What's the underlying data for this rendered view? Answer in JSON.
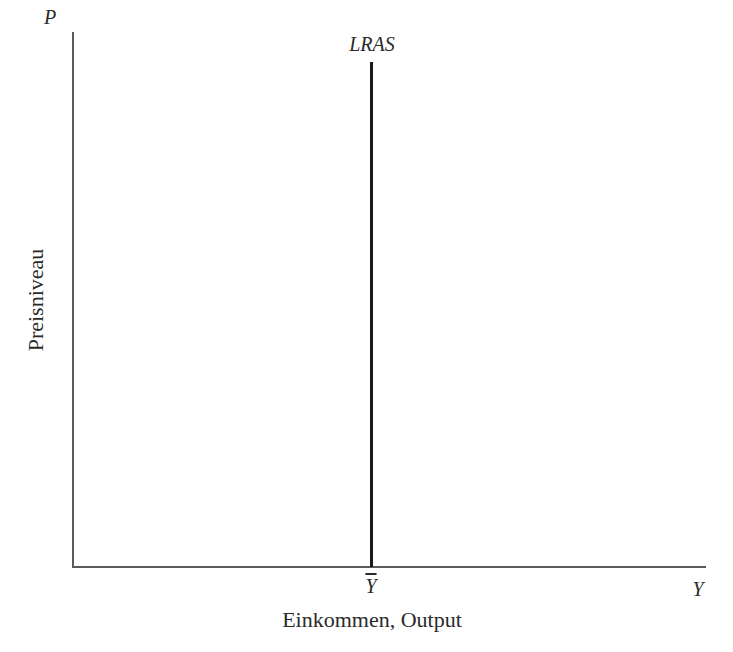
{
  "chart_data": {
    "type": "line",
    "title": "",
    "xlabel": "Einkommen, Output",
    "ylabel": "Preisniveau",
    "x_axis_symbol": "Y",
    "y_axis_symbol": "P",
    "x_ticks": [
      {
        "label": "Ȳ",
        "position": "potential output (natural level)"
      }
    ],
    "series": [
      {
        "name": "LRAS",
        "kind": "vertical_line",
        "x": "Ȳ",
        "description": "Long-run aggregate supply curve, vertical at potential output"
      }
    ],
    "grid": false,
    "legend": "none (curve labeled directly)",
    "axis_ranges": {
      "x": "qualitative, 0 to Y",
      "y": "qualitative, 0 to P"
    }
  },
  "labels": {
    "p_axis": "P",
    "y_axis_end": "Y",
    "lras": "LRAS",
    "ybar": "Y",
    "xlabel": "Einkommen, Output",
    "ylabel": "Preisniveau"
  },
  "colors": {
    "axis": "#5a5a5a",
    "curve": "#1a1a1a",
    "text": "#2a2a2a",
    "background": "#ffffff"
  }
}
